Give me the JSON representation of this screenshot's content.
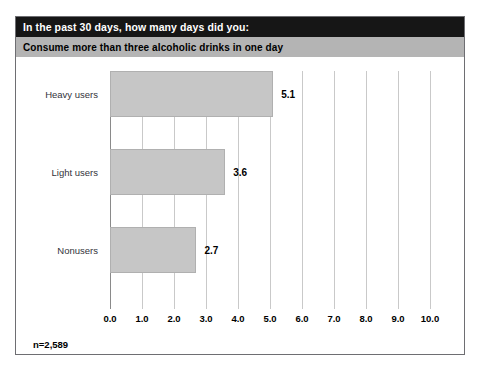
{
  "header": {
    "title_prefix": "In the past 30 days, how many ",
    "title_emphasis": "days",
    "title_suffix": " did you:",
    "subtitle": "Consume more than three alcoholic drinks in one day"
  },
  "footnote": "n=2,589",
  "colors": {
    "title_bar": "#161616",
    "subtitle_bar": "#b4b4b4",
    "bar_fill": "#c6c6c6",
    "bar_border": "#b0b0b0",
    "gridline": "#c9c9c9",
    "frame_border": "#6e6e72",
    "background": "#ffffff"
  },
  "chart_data": {
    "type": "bar",
    "orientation": "horizontal",
    "title": "In the past 30 days, how many days did you:",
    "subtitle": "Consume more than three alcoholic drinks in one day",
    "xlabel": "",
    "ylabel": "",
    "categories": [
      "Heavy users",
      "Light users",
      "Nonusers"
    ],
    "values": [
      5.1,
      3.6,
      2.7
    ],
    "value_labels": [
      "5.1",
      "3.6",
      "2.7"
    ],
    "xlim": [
      0,
      10
    ],
    "xticks": [
      0,
      1,
      2,
      3,
      4,
      5,
      6,
      7,
      8,
      9,
      10
    ],
    "xtick_labels": [
      "0.0",
      "1.0",
      "2.0",
      "3.0",
      "4.0",
      "5.0",
      "6.0",
      "7.0",
      "8.0",
      "9.0",
      "10.0"
    ],
    "grid": true,
    "legend": null,
    "sample_size": "n=2,589"
  }
}
